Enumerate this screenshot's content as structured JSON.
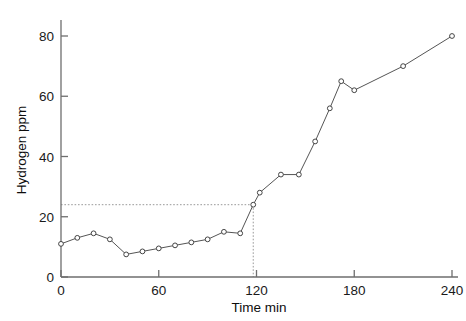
{
  "chart_data": {
    "type": "line",
    "title": "",
    "xlabel": "Time  min",
    "ylabel": "Hydrogen ppm",
    "xlim": [
      0,
      240
    ],
    "ylim": [
      0,
      85
    ],
    "xticks": [
      0,
      60,
      120,
      180,
      240
    ],
    "yticks": [
      0,
      20,
      40,
      60,
      80
    ],
    "xtick_labels": [
      "0",
      "60",
      "120",
      "180",
      "240"
    ],
    "ytick_labels": [
      "0",
      "20",
      "40",
      "60",
      "80"
    ],
    "grid": false,
    "legend": null,
    "marker": "open-circle",
    "line_color": "#555555",
    "marker_color": "#444444",
    "series": [
      {
        "name": "Hydrogen",
        "x": [
          0,
          10,
          20,
          30,
          40,
          50,
          60,
          70,
          80,
          90,
          100,
          110,
          118,
          122,
          135,
          146,
          156,
          165,
          172,
          180,
          210,
          240
        ],
        "y": [
          11,
          13,
          14.5,
          12.5,
          7.5,
          8.5,
          9.5,
          10.5,
          11.5,
          12.5,
          15,
          14.5,
          24,
          28,
          34,
          34,
          45,
          56,
          65,
          62,
          70,
          80
        ]
      }
    ],
    "annotations": [
      {
        "name": "breakpoint-guide",
        "type": "dotted-crosshair",
        "x": 118,
        "y": 24,
        "style": "dotted",
        "color": "#999999"
      }
    ]
  },
  "axes": {
    "y_axis_name": "hydrogen-ppm-axis",
    "x_axis_name": "time-min-axis"
  }
}
